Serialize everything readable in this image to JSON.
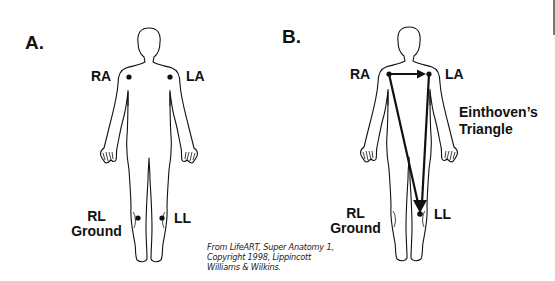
{
  "figure": {
    "panels": [
      {
        "id": "A",
        "label": "A.",
        "electrodes": {
          "ra": "RA",
          "la": "LA",
          "rl_line1": "RL",
          "rl_line2": "Ground",
          "ll": "LL"
        }
      },
      {
        "id": "B",
        "label": "B.",
        "electrodes": {
          "ra": "RA",
          "la": "LA",
          "rl_line1": "RL",
          "rl_line2": "Ground",
          "ll": "LL"
        },
        "annotation_line1": "Einthoven’s",
        "annotation_line2": "Triangle",
        "triangle_arrows": [
          {
            "from": "RA",
            "to": "LA"
          },
          {
            "from": "RA",
            "to": "LL"
          },
          {
            "from": "LA",
            "to": "LL"
          }
        ]
      }
    ],
    "credit": {
      "line1": "From LifeART, Super Anatomy 1,",
      "line2": "Copyright 1998, Lippincott",
      "line3": "Williams & Wilkins."
    },
    "colors": {
      "ink": "#111111",
      "background": "#ffffff"
    }
  }
}
